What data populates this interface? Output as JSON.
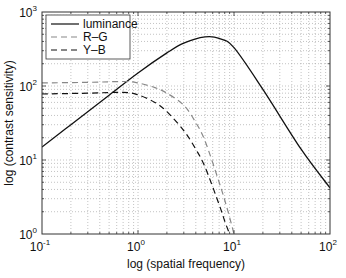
{
  "chart_data": {
    "type": "line",
    "title": "",
    "xlabel": "log (spatial frequency)",
    "ylabel": "log (contrast sensitivity)",
    "xscale": "log",
    "yscale": "log",
    "xlim": [
      0.1,
      100
    ],
    "ylim": [
      1,
      1000
    ],
    "grid": true,
    "grid_style": "dotted minor+major",
    "legend_position": "upper left",
    "x_ticks": [
      {
        "base": "10",
        "exp": "-1",
        "value": 0.1
      },
      {
        "base": "10",
        "exp": "0",
        "value": 1
      },
      {
        "base": "10",
        "exp": "1",
        "value": 10
      },
      {
        "base": "10",
        "exp": "2",
        "value": 100
      }
    ],
    "y_ticks": [
      {
        "base": "10",
        "exp": "0",
        "value": 1
      },
      {
        "base": "10",
        "exp": "1",
        "value": 10
      },
      {
        "base": "10",
        "exp": "2",
        "value": 100
      },
      {
        "base": "10",
        "exp": "3",
        "value": 1000
      }
    ],
    "series": [
      {
        "name": "luminance",
        "style": "solid",
        "color": "#111111",
        "x": [
          0.1,
          0.2,
          0.5,
          1,
          2,
          3,
          5,
          7,
          10,
          20,
          50,
          100
        ],
        "y": [
          15,
          30,
          75,
          150,
          280,
          380,
          460,
          440,
          330,
          90,
          14,
          4.2
        ]
      },
      {
        "name": "R–G",
        "style": "dashed",
        "color": "#888888",
        "x": [
          0.1,
          0.3,
          0.7,
          1,
          1.5,
          2,
          3,
          4,
          5,
          7,
          8.5,
          10
        ],
        "y": [
          110,
          112,
          115,
          110,
          95,
          80,
          55,
          32,
          18,
          5,
          2.2,
          1
        ]
      },
      {
        "name": "Y–B",
        "style": "dashed",
        "color": "#111111",
        "x": [
          0.1,
          0.3,
          0.7,
          1,
          1.5,
          2,
          3,
          4,
          5,
          7,
          8,
          9
        ],
        "y": [
          78,
          80,
          82,
          76,
          60,
          45,
          25,
          14,
          8,
          2.5,
          1.5,
          1
        ]
      }
    ]
  },
  "plot_box": {
    "left": 42,
    "top": 12,
    "right": 330,
    "bottom": 234
  },
  "legend_box": {
    "x": 46,
    "y": 15,
    "width": 84,
    "height": 44
  }
}
